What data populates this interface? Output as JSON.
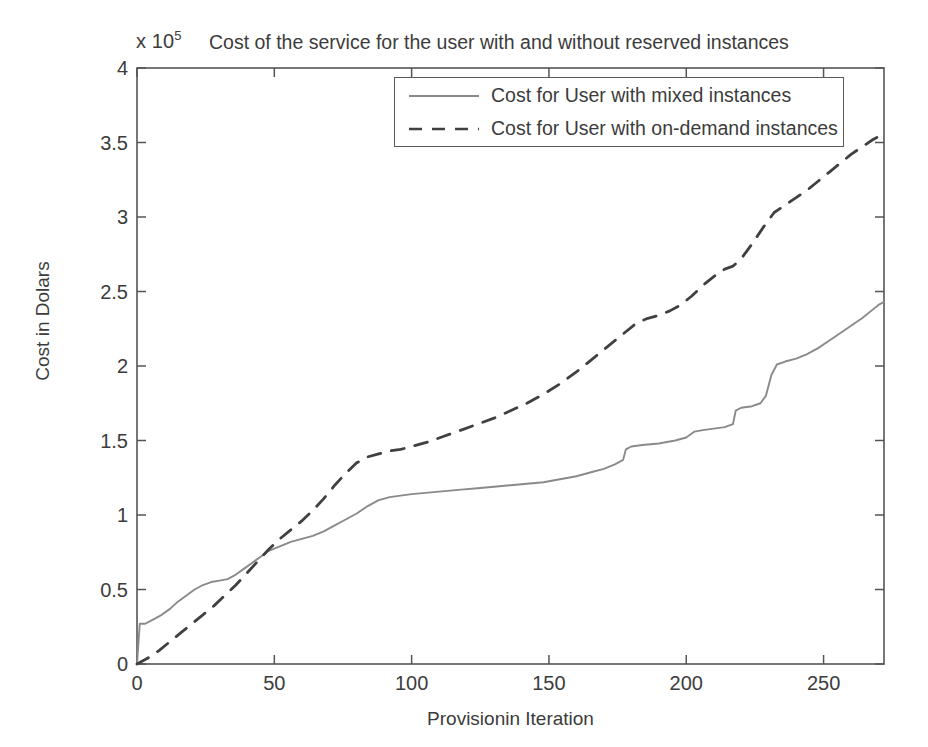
{
  "chart_data": {
    "type": "line",
    "title": "Cost of the service for the user with and without reserved instances",
    "multiplier_prefix": "x 10",
    "multiplier_exponent": "5",
    "xlabel": "Provisionin Iteration",
    "ylabel": "Cost in Dolars",
    "xlim": [
      0,
      272
    ],
    "ylim": [
      0,
      4
    ],
    "xticks": [
      0,
      50,
      100,
      150,
      200,
      250
    ],
    "xtick_labels": [
      "0",
      "50",
      "100",
      "150",
      "200",
      "250"
    ],
    "yticks": [
      0,
      0.5,
      1,
      1.5,
      2,
      2.5,
      3,
      3.5,
      4
    ],
    "ytick_labels": [
      "0",
      "0.5",
      "1",
      "1.5",
      "2",
      "2.5",
      "3",
      "3.5",
      "4"
    ],
    "y_scale_note": "values in units of 1e5 dollars",
    "grid": false,
    "legend_position": "top-center",
    "series": [
      {
        "name": "Cost for User with mixed instances",
        "style": "solid",
        "color": "#8a8a8a",
        "points": [
          [
            0,
            0.0
          ],
          [
            1,
            0.27
          ],
          [
            3,
            0.27
          ],
          [
            6,
            0.3
          ],
          [
            9,
            0.33
          ],
          [
            12,
            0.37
          ],
          [
            15,
            0.42
          ],
          [
            18,
            0.46
          ],
          [
            21,
            0.5
          ],
          [
            24,
            0.53
          ],
          [
            27,
            0.55
          ],
          [
            30,
            0.56
          ],
          [
            33,
            0.57
          ],
          [
            36,
            0.6
          ],
          [
            39,
            0.64
          ],
          [
            42,
            0.68
          ],
          [
            45,
            0.72
          ],
          [
            48,
            0.76
          ],
          [
            52,
            0.79
          ],
          [
            56,
            0.82
          ],
          [
            60,
            0.84
          ],
          [
            64,
            0.86
          ],
          [
            68,
            0.89
          ],
          [
            72,
            0.93
          ],
          [
            76,
            0.97
          ],
          [
            80,
            1.01
          ],
          [
            84,
            1.06
          ],
          [
            88,
            1.1
          ],
          [
            92,
            1.12
          ],
          [
            96,
            1.13
          ],
          [
            100,
            1.14
          ],
          [
            106,
            1.15
          ],
          [
            112,
            1.16
          ],
          [
            118,
            1.17
          ],
          [
            124,
            1.18
          ],
          [
            130,
            1.19
          ],
          [
            136,
            1.2
          ],
          [
            142,
            1.21
          ],
          [
            148,
            1.22
          ],
          [
            154,
            1.24
          ],
          [
            160,
            1.26
          ],
          [
            166,
            1.29
          ],
          [
            170,
            1.31
          ],
          [
            174,
            1.34
          ],
          [
            177,
            1.37
          ],
          [
            178,
            1.44
          ],
          [
            180,
            1.46
          ],
          [
            184,
            1.47
          ],
          [
            190,
            1.48
          ],
          [
            196,
            1.5
          ],
          [
            200,
            1.52
          ],
          [
            203,
            1.56
          ],
          [
            206,
            1.57
          ],
          [
            210,
            1.58
          ],
          [
            214,
            1.59
          ],
          [
            217,
            1.61
          ],
          [
            218,
            1.7
          ],
          [
            220,
            1.72
          ],
          [
            224,
            1.73
          ],
          [
            227,
            1.75
          ],
          [
            229,
            1.8
          ],
          [
            231,
            1.94
          ],
          [
            233,
            2.01
          ],
          [
            236,
            2.03
          ],
          [
            240,
            2.05
          ],
          [
            244,
            2.08
          ],
          [
            248,
            2.12
          ],
          [
            252,
            2.17
          ],
          [
            256,
            2.22
          ],
          [
            260,
            2.27
          ],
          [
            264,
            2.32
          ],
          [
            268,
            2.38
          ],
          [
            270,
            2.41
          ],
          [
            272,
            2.43
          ]
        ]
      },
      {
        "name": "Cost for User with on-demand instances",
        "style": "dashed",
        "color": "#404040",
        "points": [
          [
            0,
            0.0
          ],
          [
            4,
            0.04
          ],
          [
            8,
            0.09
          ],
          [
            12,
            0.15
          ],
          [
            16,
            0.21
          ],
          [
            20,
            0.27
          ],
          [
            24,
            0.33
          ],
          [
            28,
            0.39
          ],
          [
            32,
            0.46
          ],
          [
            36,
            0.53
          ],
          [
            40,
            0.61
          ],
          [
            44,
            0.69
          ],
          [
            48,
            0.77
          ],
          [
            52,
            0.84
          ],
          [
            56,
            0.9
          ],
          [
            60,
            0.96
          ],
          [
            64,
            1.03
          ],
          [
            68,
            1.11
          ],
          [
            72,
            1.2
          ],
          [
            76,
            1.28
          ],
          [
            80,
            1.35
          ],
          [
            84,
            1.39
          ],
          [
            88,
            1.41
          ],
          [
            92,
            1.43
          ],
          [
            96,
            1.44
          ],
          [
            100,
            1.46
          ],
          [
            106,
            1.49
          ],
          [
            112,
            1.53
          ],
          [
            118,
            1.57
          ],
          [
            124,
            1.61
          ],
          [
            130,
            1.65
          ],
          [
            136,
            1.7
          ],
          [
            142,
            1.75
          ],
          [
            148,
            1.81
          ],
          [
            154,
            1.88
          ],
          [
            160,
            1.96
          ],
          [
            166,
            2.05
          ],
          [
            172,
            2.14
          ],
          [
            178,
            2.23
          ],
          [
            182,
            2.29
          ],
          [
            186,
            2.32
          ],
          [
            190,
            2.34
          ],
          [
            194,
            2.37
          ],
          [
            198,
            2.41
          ],
          [
            202,
            2.47
          ],
          [
            206,
            2.54
          ],
          [
            210,
            2.6
          ],
          [
            214,
            2.65
          ],
          [
            217,
            2.67
          ],
          [
            220,
            2.72
          ],
          [
            224,
            2.82
          ],
          [
            228,
            2.93
          ],
          [
            232,
            3.03
          ],
          [
            236,
            3.08
          ],
          [
            240,
            3.13
          ],
          [
            244,
            3.18
          ],
          [
            248,
            3.24
          ],
          [
            252,
            3.3
          ],
          [
            256,
            3.36
          ],
          [
            260,
            3.42
          ],
          [
            264,
            3.47
          ],
          [
            268,
            3.52
          ],
          [
            272,
            3.56
          ]
        ]
      }
    ]
  },
  "legend": {
    "items": [
      {
        "label": "Cost for User with mixed instances",
        "style": "solid"
      },
      {
        "label": "Cost for User with on-demand instances",
        "style": "dashed"
      }
    ]
  },
  "axes": {
    "frame_color": "#555555"
  }
}
